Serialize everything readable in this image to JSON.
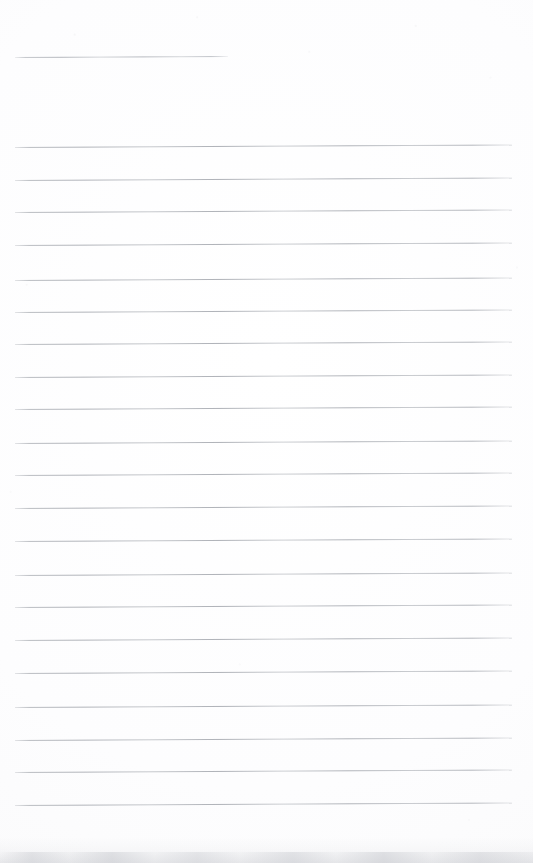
{
  "page": {
    "kind": "scanned-lined-paper",
    "width": 533,
    "height": 863,
    "background_color": "#fdfdfd",
    "paper_tone": "#fbfbfc",
    "is_blank": true,
    "content_text": "",
    "orientation": "portrait"
  },
  "rules": {
    "ink_color": "#b0b3b9",
    "thickness_px": 1,
    "left_margin_x": 15,
    "right_margin_x": 512,
    "full_width_px": 497,
    "line_spacing_px": 32.9,
    "skew_deg": -0.3,
    "header_rule": {
      "name": "header-rule",
      "y": 57,
      "x_start": 15,
      "x_end": 228,
      "width": 213,
      "label": ""
    },
    "body_rule_count": 21,
    "body_rules": [
      {
        "index": 1,
        "y": 147,
        "x_start": 15,
        "x_end": 512
      },
      {
        "index": 2,
        "y": 180,
        "x_start": 15,
        "x_end": 512
      },
      {
        "index": 3,
        "y": 212,
        "x_start": 15,
        "x_end": 512
      },
      {
        "index": 4,
        "y": 245,
        "x_start": 15,
        "x_end": 512
      },
      {
        "index": 5,
        "y": 280,
        "x_start": 15,
        "x_end": 512
      },
      {
        "index": 6,
        "y": 312,
        "x_start": 15,
        "x_end": 512
      },
      {
        "index": 7,
        "y": 344,
        "x_start": 15,
        "x_end": 512
      },
      {
        "index": 8,
        "y": 377,
        "x_start": 15,
        "x_end": 512
      },
      {
        "index": 9,
        "y": 409,
        "x_start": 15,
        "x_end": 512
      },
      {
        "index": 10,
        "y": 443,
        "x_start": 15,
        "x_end": 512
      },
      {
        "index": 11,
        "y": 475,
        "x_start": 15,
        "x_end": 512
      },
      {
        "index": 12,
        "y": 508,
        "x_start": 15,
        "x_end": 512
      },
      {
        "index": 13,
        "y": 541,
        "x_start": 15,
        "x_end": 512
      },
      {
        "index": 14,
        "y": 575,
        "x_start": 15,
        "x_end": 512
      },
      {
        "index": 15,
        "y": 607,
        "x_start": 15,
        "x_end": 512
      },
      {
        "index": 16,
        "y": 640,
        "x_start": 15,
        "x_end": 512
      },
      {
        "index": 17,
        "y": 673,
        "x_start": 15,
        "x_end": 512
      },
      {
        "index": 18,
        "y": 707,
        "x_start": 15,
        "x_end": 512
      },
      {
        "index": 19,
        "y": 740,
        "x_start": 15,
        "x_end": 512
      },
      {
        "index": 20,
        "y": 772,
        "x_start": 15,
        "x_end": 512
      },
      {
        "index": 21,
        "y": 805,
        "x_start": 15,
        "x_end": 512
      }
    ]
  },
  "artifacts": {
    "bottom_edge_shadow": {
      "name": "bottom-scan-shadow",
      "y_start": 838,
      "y_end": 863,
      "color": "#c6c8ce"
    },
    "speckle_color": "#aaacb2"
  }
}
